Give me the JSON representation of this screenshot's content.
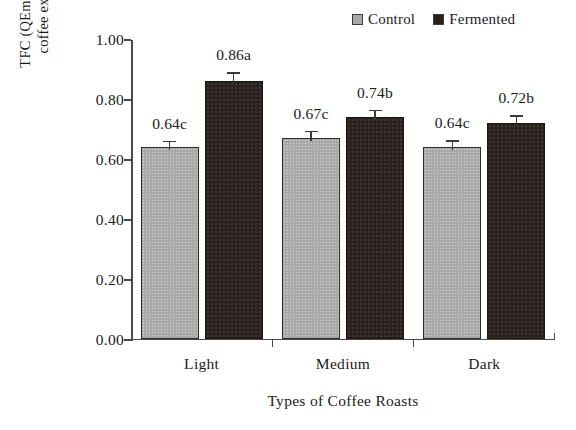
{
  "chart_data": {
    "type": "bar",
    "title": "",
    "xlabel": "Types of Coffee Roasts",
    "ylabel_line1": "TFC (QEmg/mL of",
    "ylabel_line2": "coffee extract)",
    "ylabel": "TFC (QEmg/mL of coffee extract)",
    "categories": [
      "Light",
      "Medium",
      "Dark"
    ],
    "ylim": [
      0.0,
      1.0
    ],
    "ytick_labels": [
      "0.00",
      "0.20",
      "0.40",
      "0.60",
      "0.80",
      "1.00"
    ],
    "ytick_values": [
      0.0,
      0.2,
      0.4,
      0.6,
      0.8,
      1.0
    ],
    "grid": false,
    "legend_position": "top-right",
    "series": [
      {
        "name": "Control",
        "color": "#a9a9a9",
        "values": [
          0.64,
          0.67,
          0.64
        ],
        "labels": [
          "0.64c",
          "0.67c",
          "0.64c"
        ],
        "errors": [
          0.025,
          0.028,
          0.026
        ]
      },
      {
        "name": "Fermented",
        "color": "#2a211d",
        "values": [
          0.86,
          0.74,
          0.72
        ],
        "labels": [
          "0.86a",
          "0.74b",
          "0.72b"
        ],
        "errors": [
          0.033,
          0.028,
          0.03
        ]
      }
    ]
  },
  "legend": {
    "entries": [
      {
        "label": "Control",
        "swatch": "legend-swatch-control"
      },
      {
        "label": "Fermented",
        "swatch": "legend-swatch-fermented"
      }
    ]
  },
  "axes": {
    "y_title_line1": "TFC (QEmg/mL of",
    "y_title_line2": "coffee extract)",
    "x_title": "Types of Coffee Roasts"
  },
  "ticks": {
    "y": [
      "1.00",
      "0.80",
      "0.60",
      "0.40",
      "0.20",
      "0.00"
    ]
  },
  "categories": [
    "Light",
    "Medium",
    "Dark"
  ],
  "labels": {
    "light_control": "0.64c",
    "light_fermented": "0.86a",
    "medium_control": "0.67c",
    "medium_fermented": "0.74b",
    "dark_control": "0.64c",
    "dark_fermented": "0.72b"
  }
}
